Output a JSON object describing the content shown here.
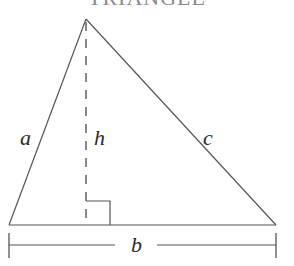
{
  "title": "TRIANGLE",
  "colors": {
    "stroke": "#555555",
    "title": "#8a8a8a",
    "label": "#2a2a2a"
  },
  "labels": {
    "side_a": "a",
    "side_b": "b",
    "side_c": "c",
    "height": "h"
  },
  "geometry": {
    "apex": [
      86,
      19
    ],
    "bottom_left": [
      9,
      225
    ],
    "bottom_right": [
      276,
      225
    ],
    "height_foot": [
      86,
      225
    ],
    "right_angle_box": {
      "x": 87,
      "y": 201,
      "size": 23
    },
    "base_measure_y": 245
  }
}
